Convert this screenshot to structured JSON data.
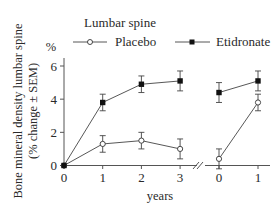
{
  "chart_data": {
    "type": "line",
    "title": "Lumbar spine",
    "ylabel_line1": "Bone mineral density lumbar spine",
    "ylabel_line2": "(% change ± SEM)",
    "y_unit": "%",
    "xlabel": "years",
    "ylim": [
      0,
      6
    ],
    "yticks": [
      0,
      2,
      4,
      6
    ],
    "panels": [
      {
        "name": "treatment",
        "x": [
          0,
          1,
          2,
          3
        ],
        "xtick_labels": [
          "0",
          "1",
          "2",
          "3"
        ]
      },
      {
        "name": "follow-up",
        "x": [
          0,
          1
        ],
        "xtick_labels": [
          "0",
          "1"
        ]
      }
    ],
    "axis_break": true,
    "legend": {
      "placement": "top",
      "entries": [
        "Placebo",
        "Etidronate"
      ]
    },
    "series": [
      {
        "name": "Placebo",
        "marker": "open-circle",
        "panels": [
          {
            "values": [
              0,
              1.3,
              1.5,
              1.0
            ],
            "errors": [
              0,
              0.5,
              0.5,
              0.6
            ]
          },
          {
            "values": [
              0.4,
              3.8
            ],
            "errors": [
              0.6,
              0.5
            ]
          }
        ]
      },
      {
        "name": "Etidronate",
        "marker": "filled-square",
        "panels": [
          {
            "values": [
              0,
              3.8,
              4.9,
              5.1
            ],
            "errors": [
              0,
              0.5,
              0.5,
              0.6
            ]
          },
          {
            "values": [
              4.4,
              5.1
            ],
            "errors": [
              0.6,
              0.6
            ]
          }
        ]
      }
    ]
  }
}
